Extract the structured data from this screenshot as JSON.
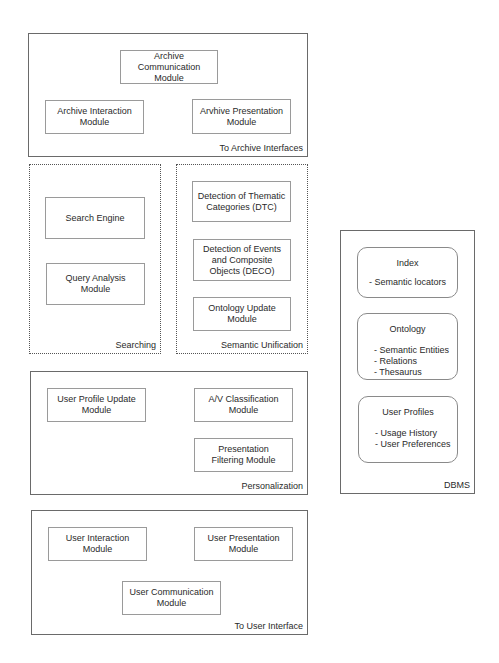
{
  "groups": {
    "archive_interfaces": {
      "label": "To Archive Interfaces",
      "modules": {
        "communication": "Archive\nCommunication\nModule",
        "interaction": "Archive Interaction\nModule",
        "presentation": "Arvhive Presentation\nModule"
      }
    },
    "searching": {
      "label": "Searching",
      "modules": {
        "search_engine": "Search Engine",
        "query_analysis": "Query Analysis\nModule"
      }
    },
    "semantic_unification": {
      "label": "Semantic Unification",
      "modules": {
        "dtc": "Detection of Thematic\nCategories (DTC)",
        "deco": "Detection of Events\nand Composite\nObjects (DECO)",
        "ontology_update": "Ontology Update\nModule"
      }
    },
    "personalization": {
      "label": "Personalization",
      "modules": {
        "user_profile_update": "User Profile Update\nModule",
        "av_classification": "A/V Classification\nModule",
        "presentation_filtering": "Presentation\nFiltering Module"
      }
    },
    "user_interface": {
      "label": "To User Interface",
      "modules": {
        "interaction": "User Interaction\nModule",
        "presentation": "User Presentation\nModule",
        "communication": "User Communication\nModule"
      }
    },
    "dbms": {
      "label": "DBMS",
      "stores": {
        "index": {
          "title": "Index",
          "items": "- Semantic locators"
        },
        "ontology": {
          "title": "Ontology",
          "items": "- Semantic Entities\n- Relations\n- Thesaurus"
        },
        "user_profiles": {
          "title": "User Profiles",
          "items": "- Usage History\n- User Preferences"
        }
      }
    }
  }
}
